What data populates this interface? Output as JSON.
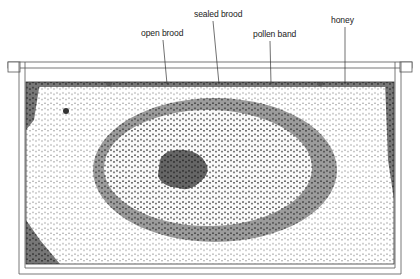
{
  "figure": {
    "type": "labeled illustration of a honeycomb brood frame",
    "labels": [
      {
        "id": "open-brood",
        "text": "open brood",
        "x": 141,
        "y": 27,
        "line": {
          "x1": 163,
          "y1": 40,
          "x2": 167,
          "y2": 84
        }
      },
      {
        "id": "sealed-brood",
        "text": "sealed brood",
        "x": 194,
        "y": 8,
        "line": {
          "x1": 213,
          "y1": 21,
          "x2": 219,
          "y2": 84
        }
      },
      {
        "id": "pollen-band",
        "text": "pollen band",
        "x": 253,
        "y": 28,
        "line": {
          "x1": 270,
          "y1": 41,
          "x2": 271,
          "y2": 84
        }
      },
      {
        "id": "honey",
        "text": "honey",
        "x": 331,
        "y": 14,
        "line": {
          "x1": 345,
          "y1": 27,
          "x2": 345,
          "y2": 84
        }
      }
    ],
    "zones": [
      {
        "name": "honey",
        "fill": "#f2f2f2",
        "cell": "#ffffff"
      },
      {
        "name": "pollen band",
        "fill": "#8a8a8a",
        "cell": "#b5b5b5"
      },
      {
        "name": "sealed brood",
        "fill": "#5a5a5a",
        "cell": "#ececec"
      },
      {
        "name": "open brood",
        "fill": "#3c3c3c",
        "cell": "#6e6e6e"
      }
    ],
    "frame_color": "#555555"
  }
}
